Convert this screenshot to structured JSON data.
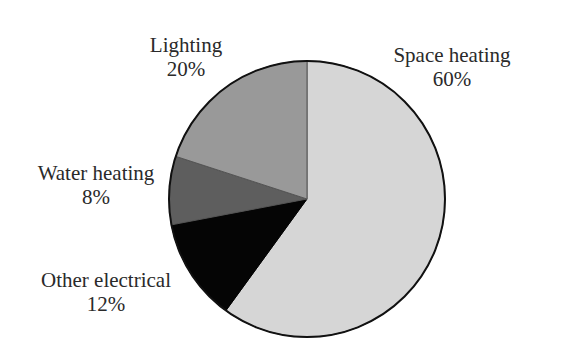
{
  "chart_data": {
    "type": "pie",
    "title": "",
    "start_angle_deg": 0,
    "direction": "clockwise",
    "slices": [
      {
        "label": "Space heating",
        "value": 60,
        "display": "60%",
        "color": "#d6d6d6"
      },
      {
        "label": "Other electrical",
        "value": 12,
        "display": "12%",
        "color": "#050505"
      },
      {
        "label": "Water heating",
        "value": 8,
        "display": "8%",
        "color": "#5e5e5e"
      },
      {
        "label": "Lighting",
        "value": 20,
        "display": "20%",
        "color": "#999999"
      }
    ],
    "labels": [
      {
        "name": "Space heating",
        "pct": "60%",
        "x": 452,
        "y": 62
      },
      {
        "name": "Other electrical",
        "pct": "12%",
        "x": 106,
        "y": 287
      },
      {
        "name": "Water heating",
        "pct": "8%",
        "x": 96,
        "y": 180
      },
      {
        "name": "Lighting",
        "pct": "20%",
        "x": 186,
        "y": 52
      }
    ],
    "center": [
      307,
      199
    ],
    "radius": 138
  }
}
